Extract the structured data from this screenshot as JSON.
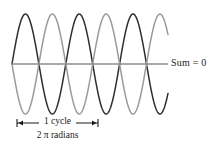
{
  "figure": {
    "background": "#ffffff",
    "width": 209,
    "height": 148
  },
  "annotations": {
    "sum_label": "Sum = 0",
    "cycle_label": "1 cycle",
    "radians_label": "2 π radians"
  },
  "chart_data": {
    "type": "line",
    "title": "",
    "xlabel": "",
    "ylabel": "",
    "grid": false,
    "legend": "none",
    "xlim": [
      0,
      5.8
    ],
    "ylim": [
      -1.05,
      1.05
    ],
    "axis_line": {
      "label": "zero line",
      "y_value": 0,
      "x_start_px": 12,
      "x_end_px": 168,
      "y_px": 64,
      "color": "#8c8c8c",
      "width_px": 1.3
    },
    "plot_box_px": {
      "x_left": 12,
      "x_right": 168,
      "y_top": 14,
      "y_bottom": 114,
      "y_zero": 64
    },
    "cycles_visible": 2.9,
    "cycle_bracket": {
      "label": "1 cycle",
      "x_start_px": 17,
      "x_end_px": 98,
      "y_px": 123,
      "tick_half_height_px": 4,
      "color": "#1a1a1a"
    },
    "series": [
      {
        "name": "wave-dark",
        "color": "#2e2e2e",
        "linewidth_px": 1.5,
        "amplitude": 1,
        "cycles_per_span": 2.9,
        "phase_deg": 0,
        "description": "dark sinusoid starting near zero rising"
      },
      {
        "name": "wave-light",
        "color": "#9a9a9a",
        "linewidth_px": 1.5,
        "amplitude": 1,
        "cycles_per_span": 2.9,
        "phase_deg": 180,
        "description": "light gray sinusoid inverted relative to dark wave"
      }
    ],
    "sum_series": {
      "name": "sum",
      "value": 0,
      "label": "Sum = 0",
      "color": "#8c8c8c"
    }
  }
}
